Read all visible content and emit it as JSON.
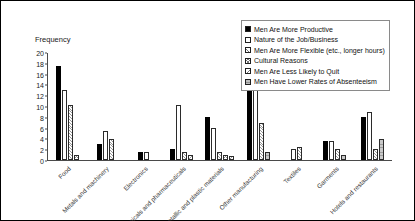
{
  "chart_data": {
    "type": "bar",
    "title": "",
    "xlabel": "",
    "ylabel": "Frequency",
    "ylim": [
      0,
      20
    ],
    "yticks": [
      0,
      2,
      4,
      6,
      8,
      10,
      12,
      14,
      16,
      18,
      20
    ],
    "grid": false,
    "legend_position": "top-right",
    "categories": [
      "Food",
      "Metals and machinery",
      "Electronics",
      "Chemicals and pharmaceuticals",
      "Non-metallic and plastic materials",
      "Other manufacturing",
      "Textiles",
      "Garments",
      "Hotels and restaurants"
    ],
    "series": [
      {
        "name": "Men Are More Productive",
        "swatch": "solid-black",
        "color": "#000000",
        "values": [
          17.5,
          3,
          1.5,
          2,
          8,
          13.5,
          0,
          3.5,
          8
        ]
      },
      {
        "name": "Nature of the Job/Business",
        "swatch": "white-empty",
        "color": "#ffffff",
        "values": [
          13,
          5.5,
          1.5,
          10.3,
          6,
          13,
          2,
          3.5,
          9
        ]
      },
      {
        "name": "Men Are More Flexible (etc., longer hours)",
        "swatch": "hatched",
        "color": "#9a9a9a",
        "values": [
          10.2,
          4,
          0,
          1.5,
          1.5,
          7,
          2.5,
          2,
          2
        ]
      },
      {
        "name": "Cultural Reasons",
        "swatch": "cross-hatched",
        "color": "#8f8f8f",
        "values": [
          1,
          0,
          0,
          0,
          1,
          0,
          0,
          0,
          0
        ]
      },
      {
        "name": "Men Are Less Likely to Quit",
        "swatch": "back-hatched",
        "color": "#999999",
        "values": [
          0,
          0,
          0,
          1,
          0.8,
          0,
          0,
          0,
          0
        ]
      },
      {
        "name": "Men Have Lower Rates of Absenteeism",
        "swatch": "gray-filled",
        "color": "#c9c9c9",
        "values": [
          0,
          0,
          0,
          0,
          0,
          1.5,
          0,
          1,
          4
        ]
      }
    ]
  }
}
